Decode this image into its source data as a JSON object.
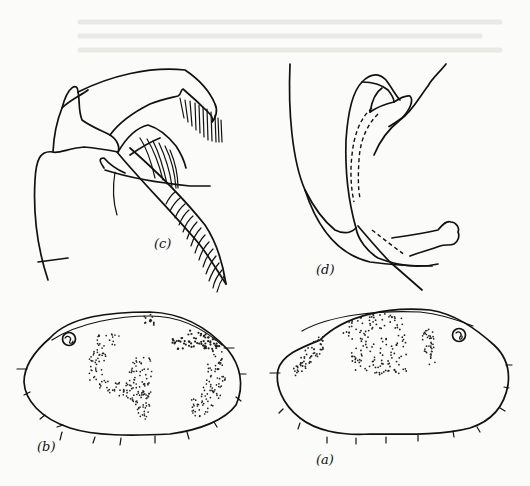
{
  "figure": {
    "panels": [
      {
        "id": "c",
        "label": "(c)",
        "subject": "appendage with setose rami"
      },
      {
        "id": "d",
        "label": "(d)",
        "subject": "copulatory organ / limb detail with dashed internal duct"
      },
      {
        "id": "b",
        "label": "(b)",
        "subject": "carapace valve, lateral view, eye spot at left, stippled pigment patches"
      },
      {
        "id": "a",
        "label": "(a)",
        "subject": "carapace valve, lateral view, eye spot at right, stippled pigment patches"
      }
    ],
    "colors": {
      "ink": "#111111",
      "paper": "#fbfbf9"
    }
  }
}
